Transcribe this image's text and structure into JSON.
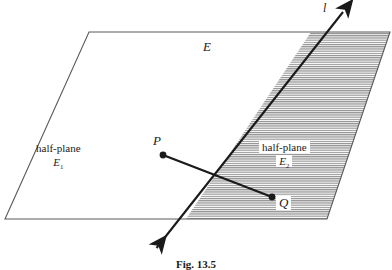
{
  "figure": {
    "caption": "Fig. 13.5",
    "plane_label": "E",
    "line_label": "l",
    "point_p_label": "P",
    "point_q_label": "Q",
    "left_region": {
      "name": "half-plane",
      "symbol": "E",
      "subscript": "1"
    },
    "right_region": {
      "name": "half-plane",
      "symbol": "E",
      "subscript": "2"
    },
    "colors": {
      "stroke": "#1a1a1a",
      "plane_edge": "#555555",
      "hatch": "#8a8a8a",
      "background": "#ffffff"
    }
  },
  "geometry": {
    "plane_corners": [
      [
        89,
        32
      ],
      [
        390,
        32
      ],
      [
        327,
        219
      ],
      [
        5,
        219
      ]
    ],
    "line_endpoints": [
      [
        155,
        250
      ],
      [
        345,
        10
      ]
    ],
    "line_plane_crossings": [
      [
        186,
        219
      ],
      [
        311,
        32
      ]
    ],
    "point_p": [
      163,
      155
    ],
    "point_q": [
      272,
      197
    ],
    "shaded_region": [
      [
        311,
        32
      ],
      [
        390,
        32
      ],
      [
        327,
        219
      ],
      [
        186,
        219
      ]
    ]
  }
}
